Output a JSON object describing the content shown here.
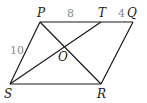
{
  "diagram": {
    "type": "geometry-parallelogram",
    "points": {
      "P": {
        "label": "P",
        "x": 40,
        "y": 22
      },
      "T": {
        "label": "T",
        "x": 101,
        "y": 22
      },
      "Q": {
        "label": "Q",
        "x": 133,
        "y": 22
      },
      "S": {
        "label": "S",
        "x": 10,
        "y": 84
      },
      "R": {
        "label": "R",
        "x": 101,
        "y": 84
      },
      "O": {
        "label": "O",
        "x": 64,
        "y": 47
      }
    },
    "segments": [
      {
        "from": "P",
        "to": "Q"
      },
      {
        "from": "Q",
        "to": "R"
      },
      {
        "from": "R",
        "to": "S"
      },
      {
        "from": "S",
        "to": "P"
      },
      {
        "from": "P",
        "to": "R"
      },
      {
        "from": "S",
        "to": "T"
      }
    ],
    "measurements": {
      "PT": "8",
      "TQ": "4",
      "PS": "10"
    },
    "colors": {
      "lines": "#1a1a1a",
      "measurements": "#8a8a8a"
    }
  }
}
